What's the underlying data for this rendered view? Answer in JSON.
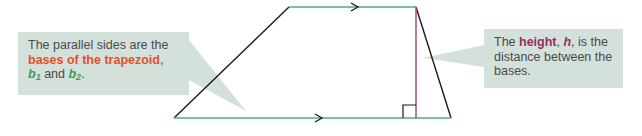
{
  "colors": {
    "callout_bg": "#d4e1db",
    "text": "#4a4a4a",
    "base_line": "#4cae78",
    "leg_line": "#1a1a1a",
    "height_line": "#a3416d",
    "emphasis_orange": "#e4502a",
    "emphasis_green": "#3b9d5a",
    "emphasis_purple": "#9a2d5c"
  },
  "left_callout": {
    "text_1": "The parallel sides are the ",
    "bases_term": "bases of the trapezoid",
    "comma": ",",
    "b": "b",
    "sub1": "1",
    "and": " and ",
    "b2": "b",
    "sub2": "2",
    "period": "."
  },
  "right_callout": {
    "text_1": "The ",
    "height_term": "height",
    "comma_1": ", ",
    "h": "h",
    "text_2": ", is the distance between the bases."
  },
  "trapezoid": {
    "vertices": {
      "bottom_left": [
        174,
        118
      ],
      "top_left": [
        289,
        7
      ],
      "top_right": [
        416,
        7
      ],
      "bottom_right": [
        451,
        118
      ]
    },
    "top_arrow": [
      356,
      7
    ],
    "bottom_arrow": [
      320,
      118
    ],
    "height_x": 416,
    "right_angle_size": 13
  }
}
